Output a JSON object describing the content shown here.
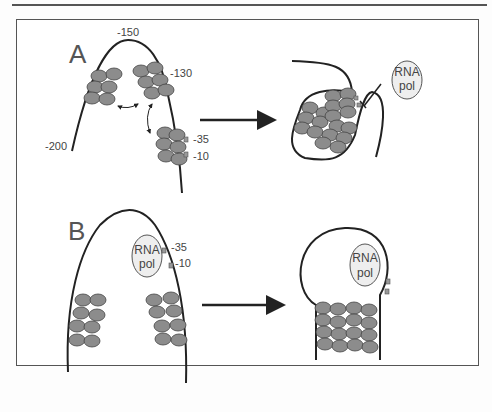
{
  "figure": {
    "panels": [
      {
        "id": "A",
        "label": "A",
        "left_labels": {
          "pos_150": "-150",
          "pos_130": "-130",
          "pos_200": "-200",
          "pos_35": "-35",
          "pos_10": "-10"
        },
        "rna_pol": {
          "line1": "RNA",
          "line2": "pol"
        }
      },
      {
        "id": "B",
        "label": "B",
        "left_labels": {
          "pos_35": "-35",
          "pos_10": "-10"
        },
        "rna_pol_left": {
          "line1": "RNA",
          "line2": "pol"
        },
        "rna_pol_right": {
          "line1": "RNA",
          "line2": "pol"
        }
      }
    ],
    "colors": {
      "nucleosome": "#8c8c8c",
      "dna": "#222222",
      "rna_pol_fill": "#eeeeee",
      "border": "#555555"
    }
  }
}
